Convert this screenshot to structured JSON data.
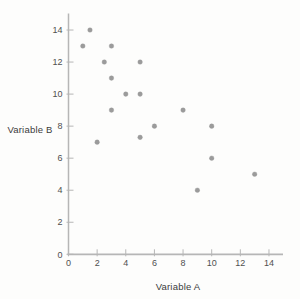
{
  "chart_data": {
    "type": "scatter",
    "title": "",
    "xlabel": "Variable A",
    "ylabel": "Variable B",
    "xlim": [
      0,
      15
    ],
    "ylim": [
      0,
      15
    ],
    "xticks": [
      0,
      2,
      4,
      6,
      8,
      10,
      12,
      14
    ],
    "yticks": [
      0,
      2,
      4,
      6,
      8,
      10,
      12,
      14
    ],
    "grid": false,
    "legend": null,
    "points": [
      {
        "x": 1,
        "y": 13
      },
      {
        "x": 1.5,
        "y": 14
      },
      {
        "x": 2,
        "y": 7
      },
      {
        "x": 2.5,
        "y": 12
      },
      {
        "x": 3,
        "y": 13
      },
      {
        "x": 3,
        "y": 11
      },
      {
        "x": 3,
        "y": 9
      },
      {
        "x": 4,
        "y": 10
      },
      {
        "x": 5,
        "y": 12
      },
      {
        "x": 5,
        "y": 10
      },
      {
        "x": 5,
        "y": 7.3
      },
      {
        "x": 6,
        "y": 8
      },
      {
        "x": 8,
        "y": 9
      },
      {
        "x": 9,
        "y": 4
      },
      {
        "x": 10,
        "y": 8
      },
      {
        "x": 10,
        "y": 6
      },
      {
        "x": 13,
        "y": 5
      }
    ],
    "point_color": "#969696",
    "axis_color": "#b6b6b6",
    "text_color": "#4f4f4f",
    "background_color": "#fdfdfc"
  }
}
